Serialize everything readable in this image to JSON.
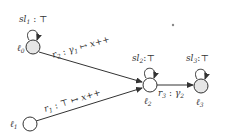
{
  "diagram": {
    "type": "automaton",
    "colors": {
      "stroke": "#333333",
      "shaded_fill": "#e6e6e6",
      "plain_fill": "#ffffff"
    },
    "nodes": [
      {
        "id": "l0",
        "label": "ℓ0",
        "sub": "0",
        "self_loop_label": "sl1:⊤",
        "sl_sub": "1",
        "shaded": true
      },
      {
        "id": "l1",
        "label": "ℓ1",
        "sub": "1",
        "shaded": false
      },
      {
        "id": "l2",
        "label": "ℓ2",
        "sub": "2",
        "self_loop_label": "sl2:⊤",
        "sl_sub": "2",
        "shaded": false
      },
      {
        "id": "l3",
        "label": "ℓ3",
        "sub": "3",
        "self_loop_label": "sl3:⊤",
        "sl_sub": "3",
        "shaded": true
      }
    ],
    "edges": [
      {
        "from": "l0",
        "to": "l2",
        "label": "r2 : γ1 ↦ x++",
        "name": "r",
        "sub": "2",
        "guard": "γ",
        "guard_sub": "1",
        "update": " ↦ x++"
      },
      {
        "from": "l1",
        "to": "l2",
        "label": "r1 : ⊤ ↦ x++",
        "name": "r",
        "sub": "1",
        "guard": "⊤",
        "update": " ↦ x++"
      },
      {
        "from": "l2",
        "to": "l3",
        "label": "r3 : γ2",
        "name": "r",
        "sub": "3",
        "guard": "γ",
        "guard_sub": "2"
      }
    ],
    "sl_prefix": "sl",
    "ell": "ℓ",
    "top": "⊤",
    "colon": " : ",
    "colon_tight": ":"
  }
}
